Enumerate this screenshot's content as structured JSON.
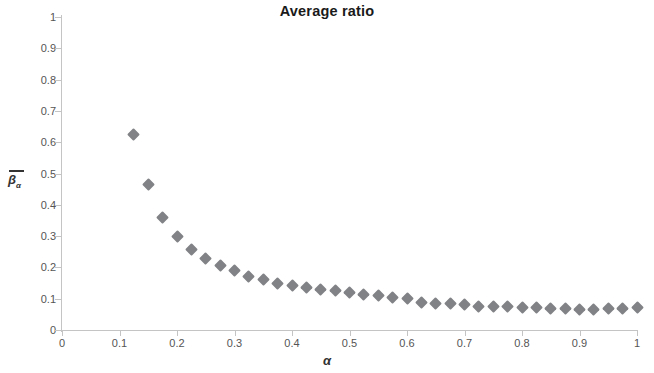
{
  "chart_data": {
    "type": "scatter",
    "title": "Average ratio",
    "xlabel": "α",
    "ylabel": "β̅ₐ",
    "ylabel_symbol": "β",
    "ylabel_subscript": "α",
    "ylabel_overbar": true,
    "xlim": [
      0,
      1
    ],
    "ylim": [
      0,
      1
    ],
    "xticks": [
      0,
      0.1,
      0.2,
      0.3,
      0.4,
      0.5,
      0.6,
      0.7,
      0.8,
      0.9,
      1
    ],
    "xtick_labels": [
      "0",
      "0.1",
      "0.2",
      "0.3",
      "0.4",
      "0.5",
      "0.6",
      "0.7",
      "0.8",
      "0.9",
      "1"
    ],
    "yticks": [
      0,
      0.1,
      0.2,
      0.3,
      0.4,
      0.5,
      0.6,
      0.7,
      0.8,
      0.9,
      1
    ],
    "ytick_labels": [
      "0",
      "0.1",
      "0.2",
      "0.3",
      "0.4",
      "0.5",
      "0.6",
      "0.7",
      "0.8",
      "0.9",
      "1"
    ],
    "grid": false,
    "legend": false,
    "marker": "diamond",
    "marker_color": "#808285",
    "series": [
      {
        "name": "average ratio",
        "x": [
          0.125,
          0.15,
          0.175,
          0.2,
          0.225,
          0.25,
          0.275,
          0.3,
          0.325,
          0.35,
          0.375,
          0.4,
          0.425,
          0.45,
          0.475,
          0.5,
          0.525,
          0.55,
          0.575,
          0.6,
          0.625,
          0.65,
          0.675,
          0.7,
          0.725,
          0.75,
          0.775,
          0.8,
          0.825,
          0.85,
          0.875,
          0.9,
          0.925,
          0.95,
          0.975,
          1.0
        ],
        "values": [
          0.625,
          0.465,
          0.36,
          0.3,
          0.258,
          0.23,
          0.205,
          0.19,
          0.172,
          0.16,
          0.15,
          0.143,
          0.137,
          0.13,
          0.125,
          0.12,
          0.113,
          0.11,
          0.105,
          0.1,
          0.088,
          0.086,
          0.084,
          0.08,
          0.076,
          0.075,
          0.074,
          0.073,
          0.072,
          0.07,
          0.068,
          0.067,
          0.067,
          0.068,
          0.07,
          0.072
        ]
      }
    ]
  }
}
